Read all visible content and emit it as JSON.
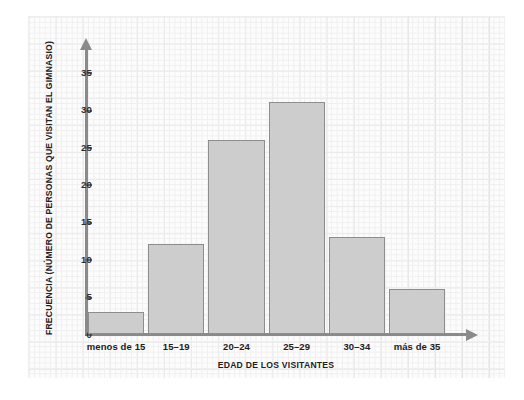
{
  "chart_data": {
    "type": "bar",
    "title": "",
    "subtitle": "",
    "xlabel": "EDAD DE LOS VISITANTES",
    "ylabel": "FRECUENCIA (NÚMERO DE PERSONAS QUE VISITAN EL GIMNASIO)",
    "categories": [
      "menos de 15",
      "15–19",
      "20–24",
      "25–29",
      "30–34",
      "más de 35"
    ],
    "values": [
      3,
      12,
      26,
      31,
      13,
      6
    ],
    "ylim": [
      0,
      38
    ],
    "yticks": [
      0,
      5,
      10,
      15,
      20,
      25,
      30,
      35
    ],
    "ytick_labels": [
      "0",
      "5",
      "10",
      "15",
      "20",
      "25",
      "30",
      "35"
    ],
    "grid": true,
    "legend": null,
    "bar_color": "#cdcdcd",
    "bar_border_color": "#8d8d8d",
    "axis_color": "#8a8a8a",
    "grid_color": "#e2e2e2",
    "background_color": "#fcfcfc"
  }
}
